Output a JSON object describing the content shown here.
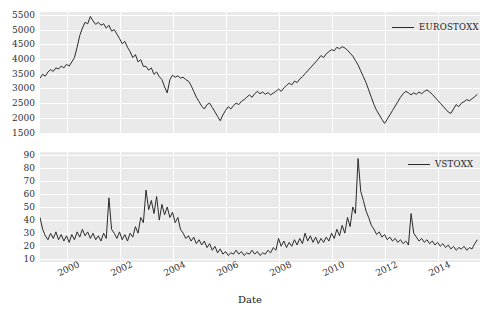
{
  "chart_data": [
    {
      "type": "line",
      "title": "",
      "xlabel": "",
      "ylabel": "",
      "legend": "EUROSTOXX",
      "legend_position": "upper right",
      "grid": true,
      "line_color": "#2b2b2b",
      "background_color": "#EAEAEA",
      "gridline_color": "#FFFFFF",
      "xlim": [
        1999.0,
        2015.6
      ],
      "ylim": [
        1450,
        5600
      ],
      "yticks": [
        1500,
        2000,
        2500,
        3000,
        3500,
        4000,
        4500,
        5000,
        5500
      ],
      "xticks": [
        2000,
        2002,
        2004,
        2006,
        2008,
        2010,
        2012,
        2014
      ],
      "x": [
        1999.0,
        1999.1,
        1999.2,
        1999.3,
        1999.4,
        1999.5,
        1999.6,
        1999.7,
        1999.8,
        1999.9,
        2000.0,
        2000.1,
        2000.2,
        2000.3,
        2000.4,
        2000.5,
        2000.6,
        2000.7,
        2000.8,
        2000.9,
        2001.0,
        2001.1,
        2001.2,
        2001.3,
        2001.4,
        2001.5,
        2001.6,
        2001.7,
        2001.8,
        2001.9,
        2002.0,
        2002.1,
        2002.2,
        2002.3,
        2002.4,
        2002.5,
        2002.6,
        2002.7,
        2002.8,
        2002.9,
        2003.0,
        2003.1,
        2003.2,
        2003.3,
        2003.4,
        2003.5,
        2003.6,
        2003.7,
        2003.8,
        2003.9,
        2004.0,
        2004.1,
        2004.2,
        2004.3,
        2004.4,
        2004.5,
        2004.6,
        2004.7,
        2004.8,
        2004.9,
        2005.0,
        2005.1,
        2005.2,
        2005.3,
        2005.4,
        2005.5,
        2005.6,
        2005.7,
        2005.8,
        2005.9,
        2006.0,
        2006.1,
        2006.2,
        2006.3,
        2006.4,
        2006.5,
        2006.6,
        2006.7,
        2006.8,
        2006.9,
        2007.0,
        2007.1,
        2007.2,
        2007.3,
        2007.4,
        2007.5,
        2007.6,
        2007.7,
        2007.8,
        2007.9,
        2008.0,
        2008.1,
        2008.2,
        2008.3,
        2008.4,
        2008.5,
        2008.6,
        2008.7,
        2008.8,
        2008.9,
        2009.0,
        2009.1,
        2009.2,
        2009.3,
        2009.4,
        2009.5,
        2009.6,
        2009.7,
        2009.8,
        2009.9,
        2010.0,
        2010.1,
        2010.2,
        2010.3,
        2010.4,
        2010.5,
        2010.6,
        2010.7,
        2010.8,
        2010.9,
        2011.0,
        2011.1,
        2011.2,
        2011.3,
        2011.4,
        2011.5,
        2011.6,
        2011.7,
        2011.8,
        2011.9,
        2012.0,
        2012.1,
        2012.2,
        2012.3,
        2012.4,
        2012.5,
        2012.6,
        2012.7,
        2012.8,
        2012.9,
        2013.0,
        2013.1,
        2013.2,
        2013.3,
        2013.4,
        2013.5,
        2013.6,
        2013.7,
        2013.8,
        2013.9,
        2014.0,
        2014.1,
        2014.2,
        2014.3,
        2014.4,
        2014.5,
        2014.6,
        2014.7,
        2014.8,
        2014.9,
        2015.0,
        2015.1,
        2015.2,
        2015.3,
        2015.4,
        2015.5
      ],
      "values": [
        3350,
        3480,
        3420,
        3560,
        3640,
        3580,
        3700,
        3660,
        3760,
        3700,
        3820,
        3760,
        3900,
        4050,
        4400,
        4800,
        5050,
        5250,
        5200,
        5450,
        5300,
        5180,
        5250,
        5150,
        5200,
        5050,
        5150,
        4950,
        5000,
        4850,
        4700,
        4520,
        4600,
        4400,
        4250,
        4050,
        4150,
        3900,
        3980,
        3750,
        3750,
        3620,
        3700,
        3480,
        3560,
        3400,
        3300,
        3050,
        2850,
        3300,
        3450,
        3380,
        3430,
        3350,
        3380,
        3300,
        3250,
        3100,
        2900,
        2700,
        2550,
        2400,
        2300,
        2450,
        2500,
        2350,
        2200,
        2050,
        1900,
        2100,
        2250,
        2380,
        2300,
        2420,
        2500,
        2450,
        2560,
        2620,
        2700,
        2780,
        2700,
        2820,
        2900,
        2820,
        2880,
        2800,
        2860,
        2780,
        2840,
        2900,
        2980,
        2900,
        3020,
        3100,
        3180,
        3120,
        3250,
        3200,
        3320,
        3400,
        3500,
        3600,
        3700,
        3800,
        3900,
        4000,
        4120,
        4050,
        4180,
        4250,
        4320,
        4280,
        4400,
        4350,
        4420,
        4380,
        4300,
        4200,
        4100,
        3950,
        3800,
        3600,
        3400,
        3200,
        2950,
        2700,
        2450,
        2250,
        2100,
        1950,
        1810,
        1950,
        2100,
        2250,
        2400,
        2550,
        2700,
        2820,
        2900,
        2850,
        2780,
        2850,
        2800,
        2880,
        2820,
        2900,
        2950,
        2880,
        2800,
        2700,
        2600,
        2500,
        2400,
        2300,
        2200,
        2150,
        2300,
        2450,
        2380,
        2500,
        2550,
        2620,
        2580,
        2650,
        2720,
        2800
      ],
      "notes": "Approximate weekly/monthly EURO STOXX 50 index level, 1999-2015"
    },
    {
      "type": "line",
      "title": "",
      "xlabel": "Date",
      "ylabel": "",
      "legend": "VSTOXX",
      "legend_position": "upper right",
      "grid": true,
      "line_color": "#2b2b2b",
      "background_color": "#EAEAEA",
      "gridline_color": "#FFFFFF",
      "xlim": [
        1999.0,
        2015.6
      ],
      "ylim": [
        8,
        92
      ],
      "yticks": [
        10,
        20,
        30,
        40,
        50,
        60,
        70,
        80,
        90
      ],
      "xticks": [
        2000,
        2002,
        2004,
        2006,
        2008,
        2010,
        2012,
        2014
      ],
      "values": [
        42,
        33,
        28,
        25,
        30,
        26,
        31,
        25,
        29,
        24,
        28,
        23,
        29,
        25,
        31,
        27,
        33,
        28,
        31,
        26,
        30,
        25,
        28,
        24,
        30,
        26,
        57,
        33,
        30,
        26,
        31,
        25,
        29,
        24,
        30,
        27,
        35,
        30,
        42,
        38,
        63,
        48,
        55,
        45,
        58,
        40,
        52,
        44,
        50,
        42,
        46,
        38,
        42,
        33,
        30,
        26,
        28,
        24,
        27,
        22,
        25,
        21,
        24,
        19,
        22,
        17,
        20,
        15,
        18,
        14,
        16,
        13,
        15,
        14,
        17,
        14,
        16,
        13,
        15,
        14,
        17,
        14,
        16,
        13,
        15,
        14,
        17,
        15,
        19,
        17,
        26,
        20,
        24,
        19,
        23,
        20,
        25,
        21,
        26,
        22,
        30,
        24,
        28,
        23,
        27,
        22,
        26,
        23,
        27,
        24,
        30,
        26,
        33,
        28,
        36,
        30,
        42,
        35,
        50,
        45,
        87,
        62,
        55,
        47,
        42,
        36,
        33,
        29,
        31,
        27,
        29,
        25,
        27,
        24,
        26,
        23,
        25,
        22,
        24,
        21,
        45,
        30,
        27,
        24,
        26,
        23,
        25,
        22,
        24,
        21,
        23,
        20,
        22,
        19,
        21,
        18,
        20,
        17,
        19,
        18,
        20,
        17,
        19,
        18,
        22,
        25
      ],
      "notes": "Approximate VSTOXX volatility index, 1999-2015; peak ~87 in Oct 2008"
    }
  ],
  "figure": {
    "xlabel": "Date",
    "xticks": [
      "2000",
      "2002",
      "2004",
      "2006",
      "2008",
      "2010",
      "2012",
      "2014"
    ],
    "panels": [
      {
        "legend": "EUROSTOXX",
        "yticks": [
          "5500",
          "5000",
          "4500",
          "4000",
          "3500",
          "3000",
          "2500",
          "2000",
          "1500"
        ]
      },
      {
        "legend": "VSTOXX",
        "yticks": [
          "90",
          "80",
          "70",
          "60",
          "50",
          "40",
          "30",
          "20",
          "10"
        ]
      }
    ]
  }
}
